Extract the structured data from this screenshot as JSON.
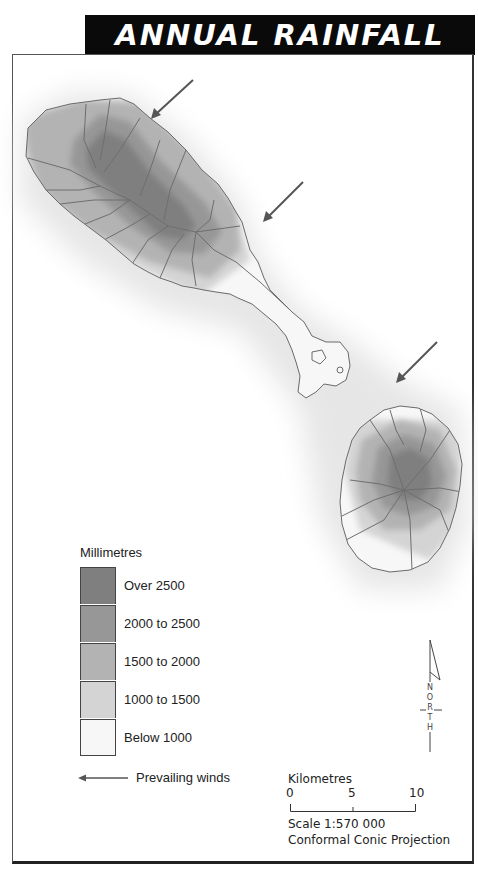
{
  "title": "ANNUAL RAINFALL",
  "legend": {
    "title": "Millimetres",
    "items": [
      {
        "label": "Over 2500",
        "color": "#7f7f7f"
      },
      {
        "label": "2000 to 2500",
        "color": "#979797"
      },
      {
        "label": "1500 to 2000",
        "color": "#b3b3b3"
      },
      {
        "label": "1000 to 1500",
        "color": "#d4d4d4"
      },
      {
        "label": "Below 1000",
        "color": "#f7f7f7"
      }
    ],
    "winds_label": "Prevailing winds"
  },
  "scale": {
    "title": "Kilometres",
    "ticks": [
      "0",
      "5",
      "10"
    ],
    "scale_text": "Scale 1:570 000",
    "projection": "Conformal Conic Projection"
  },
  "north": {
    "letters": [
      "N",
      "O",
      "R",
      "T",
      "H"
    ]
  },
  "colors": {
    "over_2500": "#7f7f7f",
    "r2000_2500": "#979797",
    "r1500_2000": "#b3b3b3",
    "r1000_1500": "#d4d4d4",
    "below_1000": "#f7f7f7",
    "coast": "#6a6a6a",
    "halo": "#e2e2e2"
  }
}
